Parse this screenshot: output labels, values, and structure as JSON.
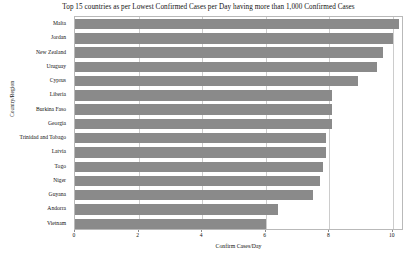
{
  "chart_data": {
    "type": "bar",
    "orientation": "horizontal",
    "title": "Top 15 countries as per Lowest Confirmed Cases per Day having more than 1,000 Confirmed Cases",
    "xlabel": "Confirm Cases/Day",
    "ylabel": "Country/Region",
    "categories": [
      "Malta",
      "Jordan",
      "New Zealand",
      "Uruguay",
      "Cyprus",
      "Liberia",
      "Burkina Faso",
      "Georgia",
      "Trinidad and Tobago",
      "Latvia",
      "Togo",
      "Niger",
      "Guyana",
      "Andorra",
      "Vietnam"
    ],
    "values": [
      10.2,
      10.0,
      9.7,
      9.5,
      8.9,
      8.1,
      8.1,
      8.1,
      7.9,
      7.9,
      7.8,
      7.7,
      7.5,
      6.4,
      6.0
    ],
    "xlim": [
      0,
      10.35
    ],
    "xticks": [
      0,
      2,
      4,
      6,
      8,
      10
    ],
    "xtick_labels": [
      "0",
      "2",
      "4",
      "6",
      "8",
      "10"
    ],
    "grid": true,
    "grid_axis": "x",
    "legend": null,
    "bar_color": "#8a8a8a",
    "frame_color": "#b9b9b9",
    "background": "#ffffff"
  }
}
